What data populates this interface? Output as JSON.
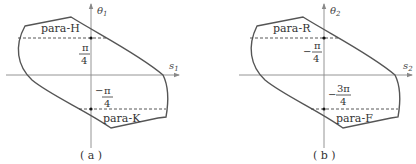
{
  "figure": {
    "panels": [
      {
        "id": "a",
        "caption": "( a )",
        "axes": {
          "x_label": "s",
          "x_sub": "1",
          "y_label": "θ",
          "y_sub": "1"
        },
        "upper_region_label": "para-H",
        "lower_region_label": "para-K",
        "upper_level": {
          "sign": "",
          "numerator": "π",
          "denominator": "4"
        },
        "lower_level": {
          "sign": "−",
          "numerator": "π",
          "denominator": "4"
        }
      },
      {
        "id": "b",
        "caption": "( b )",
        "axes": {
          "x_label": "s",
          "x_sub": "2",
          "y_label": "θ",
          "y_sub": "2"
        },
        "upper_region_label": "para-R",
        "lower_region_label": "para-F",
        "upper_level": {
          "sign": "−",
          "numerator": "π",
          "denominator": "4"
        },
        "lower_level": {
          "sign": "−",
          "numerator": "3π",
          "denominator": "4"
        }
      }
    ],
    "colors": {
      "boundary": "#555555",
      "axis": "#888888",
      "dashed": "#444444",
      "text": "#333333",
      "background": "#ffffff"
    }
  }
}
